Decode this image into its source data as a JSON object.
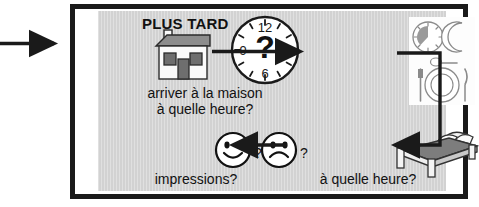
{
  "diagram": {
    "title_label": "PLUS TARD",
    "language": "fr",
    "panel_color": "#d2d2d2",
    "line_color": "#1a1a1a",
    "steps": [
      {
        "id": "arrive-home",
        "icon": "house-icon",
        "secondary_icon": "clock-question-icon",
        "caption_line1": "arriver à la maison",
        "caption_line2": "à quelle heure?"
      },
      {
        "id": "dinner",
        "icon": "dinner-place-setting-icon",
        "sub_icons": [
          "clock-icon",
          "crescent-moon-icon",
          "spoon-icon",
          "plate-icon",
          "fork-icon",
          "knife-icon"
        ],
        "caption_line1": "",
        "caption_line2": ""
      },
      {
        "id": "bedtime",
        "icon": "bed-icon",
        "caption_line1": "à quelle heure?",
        "caption_line2": ""
      },
      {
        "id": "impressions",
        "icon_happy": "happy-face-icon",
        "icon_sad": "sad-face-icon",
        "happy_suffix": "?",
        "sad_suffix": "?",
        "caption_line1": "impressions?",
        "caption_line2": ""
      }
    ],
    "clock_question": {
      "center_symbol": "?",
      "numerals": [
        "12",
        "3",
        "6",
        "9"
      ]
    },
    "arrows": [
      {
        "id": "arrow-into-panel",
        "direction": "right"
      },
      {
        "id": "arrow-home-to-dinner",
        "direction": "right"
      },
      {
        "id": "arrow-dinner-to-bed",
        "direction": "elbow-down-left"
      },
      {
        "id": "arrow-bed-to-impressions",
        "direction": "left"
      }
    ]
  }
}
